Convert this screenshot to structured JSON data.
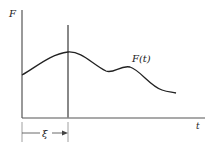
{
  "diagram": {
    "y_axis_label": "F",
    "x_axis_label": "t",
    "curve_label": "F(t)",
    "interval_label": "ξ",
    "colors": {
      "stroke": "#222222",
      "axis": "#555555",
      "marker_line": "#777777"
    }
  }
}
